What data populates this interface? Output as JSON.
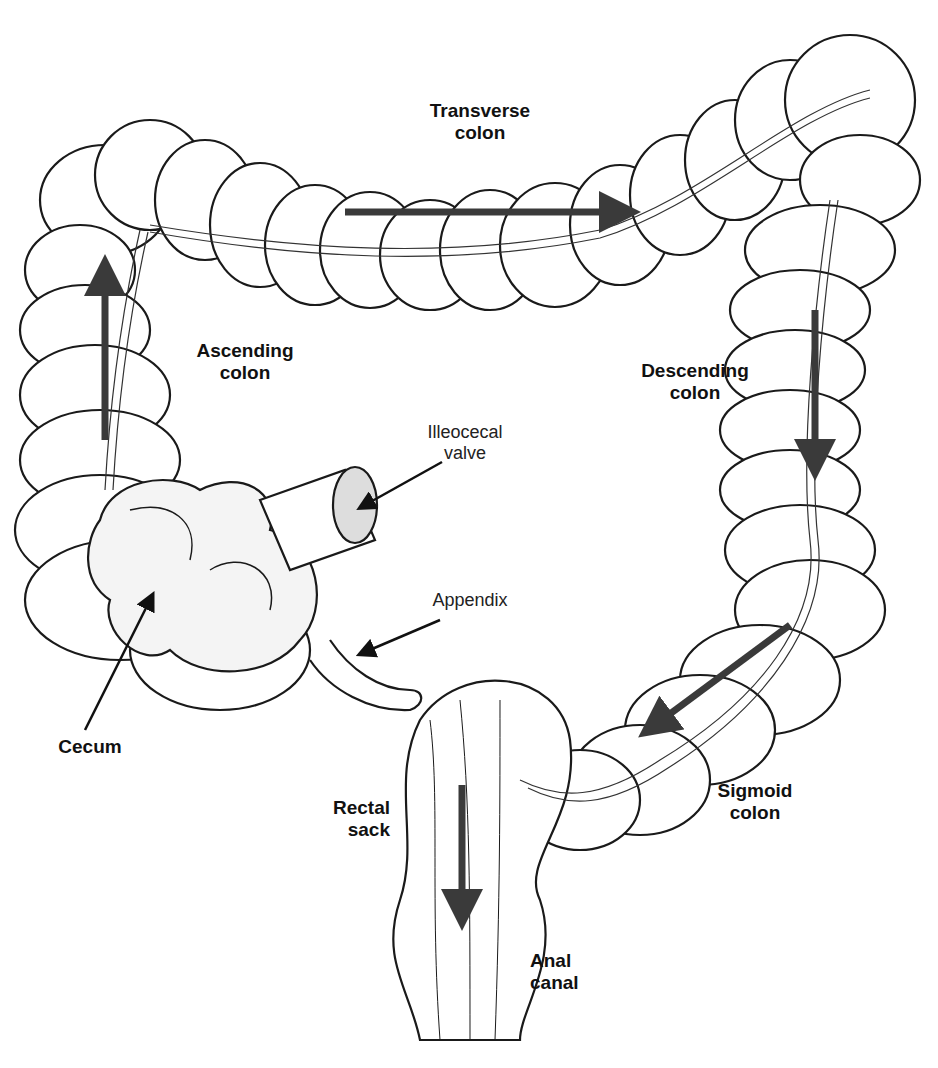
{
  "labels": {
    "transverse": {
      "line1": "Transverse",
      "line2": "colon"
    },
    "ascending": {
      "line1": "Ascending",
      "line2": "colon"
    },
    "descending": {
      "line1": "Descending",
      "line2": "colon"
    },
    "ileocecal": {
      "line1": "Illeocecal",
      "line2": "valve"
    },
    "appendix": {
      "line1": "Appendix"
    },
    "cecum": {
      "line1": "Cecum"
    },
    "sigmoid": {
      "line1": "Sigmoid",
      "line2": "colon"
    },
    "rectal": {
      "line1": "Rectal",
      "line2": "sack"
    },
    "anal": {
      "line1": "Anal",
      "line2": "canal"
    }
  },
  "colors": {
    "arrow": "#3a3a3a",
    "outline": "#1a1a1a",
    "fill": "#ffffff"
  },
  "flow_arrows": [
    "up (ascending)",
    "right (transverse)",
    "down (descending)",
    "down-left (sigmoid)",
    "down (rectum)"
  ]
}
